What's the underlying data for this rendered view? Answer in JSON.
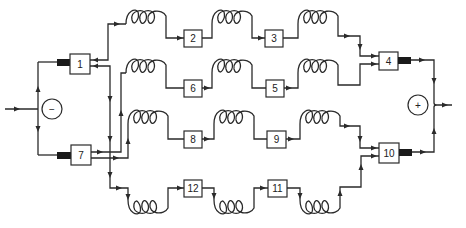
{
  "diagram": {
    "type": "series-parallel cell / battery interconnection schematic",
    "terminals": {
      "negative": {
        "symbol": "−",
        "label": "negative-terminal"
      },
      "positive": {
        "symbol": "+",
        "label": "positive-terminal"
      }
    },
    "modules": [
      {
        "id": "1",
        "label": "1"
      },
      {
        "id": "2",
        "label": "2"
      },
      {
        "id": "3",
        "label": "3"
      },
      {
        "id": "4",
        "label": "4"
      },
      {
        "id": "5",
        "label": "5"
      },
      {
        "id": "6",
        "label": "6"
      },
      {
        "id": "7",
        "label": "7"
      },
      {
        "id": "8",
        "label": "8"
      },
      {
        "id": "9",
        "label": "9"
      },
      {
        "id": "10",
        "label": "10"
      },
      {
        "id": "11",
        "label": "11"
      },
      {
        "id": "12",
        "label": "12"
      }
    ],
    "rows": [
      {
        "name": "row-1",
        "sequence": [
          "1",
          "coil",
          "2",
          "coil",
          "3",
          "coil",
          "4"
        ]
      },
      {
        "name": "row-2",
        "sequence": [
          "7",
          "coil",
          "6",
          "coil",
          "5",
          "coil",
          "4"
        ]
      },
      {
        "name": "row-3",
        "sequence": [
          "7",
          "coil",
          "8",
          "coil",
          "9",
          "coil",
          "10"
        ]
      },
      {
        "name": "row-4",
        "sequence": [
          "1",
          "coil",
          "12",
          "coil",
          "11",
          "coil",
          "10"
        ]
      }
    ],
    "colors": {
      "line": "#2a2a2a",
      "bar": "#1a1a1a",
      "background": "#ffffff"
    }
  }
}
